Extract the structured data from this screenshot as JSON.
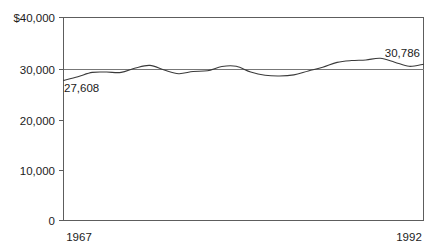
{
  "chart_data": {
    "type": "line",
    "title": "",
    "subtitle": "",
    "xlabel": "",
    "ylabel": "",
    "xlim": [
      1967,
      1992
    ],
    "ylim": [
      0,
      40000
    ],
    "grid": false,
    "legend": null,
    "reference_line": {
      "value": 30000,
      "label": "30,000"
    },
    "y_ticks": [
      {
        "value": 40000,
        "label": "$40,000"
      },
      {
        "value": 30000,
        "label": "30,000"
      },
      {
        "value": 20000,
        "label": "20,000"
      },
      {
        "value": 10000,
        "label": "10,000"
      },
      {
        "value": 0,
        "label": "0"
      }
    ],
    "x_ticks": [
      {
        "value": 1967,
        "label": "1967"
      },
      {
        "value": 1992,
        "label": "1992"
      }
    ],
    "annotations": [
      {
        "name": "start-value",
        "text": "27,608",
        "x": 1967,
        "y": 27608
      },
      {
        "name": "end-value",
        "text": "30,786",
        "x": 1992,
        "y": 30786
      }
    ],
    "series": [
      {
        "name": "median-income",
        "color": "#3a3a3a",
        "x": [
          1967,
          1968,
          1969,
          1970,
          1971,
          1972,
          1973,
          1974,
          1975,
          1976,
          1977,
          1978,
          1979,
          1980,
          1981,
          1982,
          1983,
          1984,
          1985,
          1986,
          1987,
          1988,
          1989,
          1990,
          1991,
          1992
        ],
        "values": [
          27608,
          28340,
          29180,
          29250,
          29180,
          30060,
          30560,
          29640,
          28930,
          29360,
          29500,
          30340,
          30380,
          29260,
          28620,
          28470,
          28690,
          29470,
          30180,
          31160,
          31520,
          31640,
          31960,
          31200,
          30380,
          30786
        ]
      }
    ]
  }
}
